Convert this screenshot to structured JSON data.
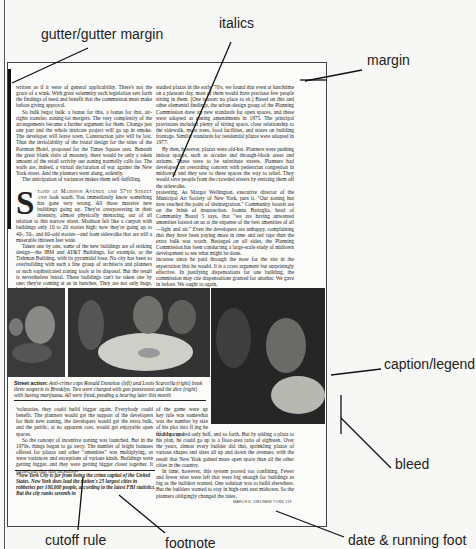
{
  "annotations": {
    "gutter": "gutter/gutter margin",
    "italics": "italics",
    "margin": "margin",
    "caption": "caption/legend",
    "bleed": "bleed",
    "cutoff_rule": "cutoff rule",
    "footnote": "footnote",
    "running_foot": "date & running foot"
  },
  "article": {
    "col1_top": [
      "written as if it were of general applicability. There's not the grace of a wink. With great solemnity each legislation sets forth the findings of need and benefit that the commission must make before giving approval.",
      "So bulk begot bulk: a bonus for this, a bonus for that, air-rights transfer, zoning-lot mergers. The very complexity of the arrangements became a further argument for them. Change just one part and the whole intricate project will go up in smoke. The developer will leave town. Construction jobs will be lost. Thus the inviolability of the brutal design for the sides of the Portman Hotel, proposed for the Times Square area. Beneath the great blank slabs of masonry, there would be only a token amount of the retail activity our zoning normally calls for. The walls are, indeed, a virtual declaration of war against the New York street. And the planners went along, ardently.",
      "The anticipation of variances makes them self-fulfilling."
    ],
    "dropcap_letter": "S",
    "dropcap_lead": "tand at Madison Avenue and 57th Street and",
    "col1_dropcap_para": " look south. You immediately know something has gone very wrong. All those massive new buildings going up. They're overpowering in their intensity, almost physically menacing, out of all relation to this narrow street. Madison felt like a canyon with buildings only 10 to 20 stories high; now they're going up to 40-, 50-, and 60-odd stories—and from sidewalks that are still a miserable thirteen feet wide.",
    "col1_para3": "Taken one by one, some of the new buildings are of striking design—the IBM and AT&T Buildings, for example, or the Tishman Building, with its pyramidal base. No city has been so overbuilding with such a fine group of architects and planners or such sophisticated zoning tools at its disposal. But the result is nevertheless brutal. These buildings can't be taken one by one; they're coming at us in bunches. They are not only huge, but huge togeth-",
    "col2_top": [
      "studied plazas in the early '70's, we found that even at lunchtime on a pleasant day, most of them would have precious few people sitting in them. (One reason: no place to sit.) Based on this and other elemental findings, the urban-design group of the Planning Commission drew up new standards for open spaces, and these were adopted as zoning amendments in 1975. The principal provisions included plenty of sitting space, close relationship to the sidewalk, more trees, food facilities, and stores on building frontage. Similar standards for residential plazas were adopted in 1977.",
      "By then, however, plazas were old-hat. Planners were pushing indoor spaces, such as arcades and through-block areas and atriums. These were to be substitute streets. Planners had developed an overriding concern with pedestrian congestion in midtown, and they saw to these spaces the way to relief. They would save people from the crowded streets by enticing them off the sidewalks.",
      "protesting. As Margot Wellington, executive director of the Municipal Art Society of New York, puts it, \"Our zoning has now reached the point of disintegration.\" Community boards are on the brink of insurrection. Joanna Battaglia, head of Community Board 5 says, that \"we are having unwanted amenities foisted on us at the expense of the best amenities of all—light and air.\" Even the developers are unhappy, complaining that they have been paying more in time and red tape than the extra bulk was worth. Besieged on all sides, the Planning Commission has been conducting a large-scale study of midtown development to see what might be done.",
      "increase since he paid through the nose for the site in the expectation that he would. It is a crass argument but surprisingly effective. In justifying dispensations for one building, the commission may cite dispensations granted for another. We gave in before. We ought to again."
    ],
    "caption": {
      "lead": "Street action:",
      "text": " Anti-crime cops Ronald Donohue (left) and Louis Scarcella (right) book three suspects in Brooklyn. Two were charged with gun possession and the dice (right) with having marijuana. All were freed, pending a hearing later this month"
    },
    "lower_col1": [
      "'volutaries, they could build bigger again. Everybody could benefit. The planners would get the support of the developers for their new zoning, the developers would get the extra bulk, and the public, at no apparent cost, would get enjoyable open spaces.",
      "So the concept of incentive zoning was launched. But in the 1970s, things began to go awry. The number of bright bonuses offered for plazas and other \"amenities\" was multiplying, as were variances and exceptions of various kinds. Buildings were getting bigger, and they were getting bigger closer together. It turned out that this incentive-"
    ],
    "lower_col2_narrow": "of the game were up key rule was somewhat was the number by size of his plot into fl ing he could go up 1",
    "lower_col2": [
      "fif it he covered only half, and so forth. But by adding a plaza to his plan, he could go up to a floor-area ratio of eighteen. Over the years, almost every builder did that, sprinkling plazas of various shapes and sizes all up and down the avenues, with the result that New York gained more open space than all the other cities in the country.",
      "In time, however, this system proved too confining. Fewer and fewer sites were left that were big enough for buildings as big as the builders wanted. One solution was to build elsewhere. But the builders wanted to stay in high-rent east midtown. So the planners obligingly changed the rules,"
    ],
    "footnote": "*New York City is far from being the crime capital of the United States. New York does lead the nation's 25 largest cities in robberies per 100,000 people, according to the latest FBI statistics. But the city ranks seventh in",
    "running_foot": "MARCH 8, 1981/NEW YORK     119"
  },
  "colors": {
    "ink": "#1a1a1a",
    "page_bg": "#fbfbf9",
    "photo_dark": "#2b2b2b"
  }
}
